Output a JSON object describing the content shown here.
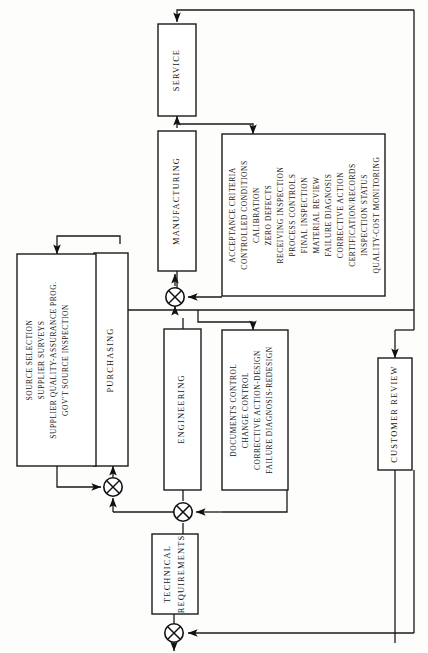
{
  "diagram": {
    "orientation": "rotated-90-ccw",
    "colors": {
      "line": "#1a1a1a",
      "box_fill": "#ffffff",
      "background": "#fdfdfc",
      "text": "#161616"
    },
    "nodes": [
      {
        "id": "service",
        "label": "SERVICE",
        "type": "process-box"
      },
      {
        "id": "manufacturing",
        "label": "MANUFACTURING",
        "type": "process-box"
      },
      {
        "id": "purchasing",
        "label": "PURCHASING",
        "type": "process-box"
      },
      {
        "id": "engineering",
        "label": "ENGINEERING",
        "type": "process-box"
      },
      {
        "id": "technical-requirements",
        "label": "TECHNICAL\nREQUIREMENTS",
        "lines": [
          "TECHNICAL",
          "REQUIREMENTS"
        ],
        "type": "process-box"
      },
      {
        "id": "customer-review",
        "label": "CUSTOMER REVIEW",
        "type": "process-box"
      }
    ],
    "detail_boxes": [
      {
        "id": "purchasing-details",
        "for": "purchasing",
        "items": [
          "SOURCE SELECTION",
          "SUPPLIER SURVEYS",
          "SUPPLIER QUALITY-ASSURANCE PROG.",
          "GOV'T SOURCE INSPECTION"
        ]
      },
      {
        "id": "manufacturing-details",
        "for": "manufacturing",
        "items": [
          "ACCEPTANCE CRITERIA",
          "CONTROLLED CONDITIONS",
          "CALIBRATION",
          "ZERO DEFECTS",
          "RECEIVING INSPECTION",
          "PROCESS CONTROLS",
          "FINAL INSPECTION",
          "MATERIAL REVIEW",
          "FAILURE  DIAGNOSIS",
          "CORRECTIVE ACTION",
          "CERTIFICATION/RECORDS",
          "INSPECTION STATUS",
          "QUALITY-COST MONITORING"
        ]
      },
      {
        "id": "engineering-details",
        "for": "engineering",
        "items": [
          "DOCUMENTS CONTROL",
          "CHANGE CONTROL",
          "CORRECTIVE ACTION-DESIGN",
          "FAILURE DIAGNOSIS-REDESIGN"
        ]
      }
    ],
    "junctions": [
      {
        "id": "junction-manufacturing",
        "x": 175,
        "y": 297
      },
      {
        "id": "junction-purchasing",
        "x": 113,
        "y": 487
      },
      {
        "id": "junction-engineering",
        "x": 183,
        "y": 512
      },
      {
        "id": "junction-output",
        "x": 174,
        "y": 633
      }
    ]
  }
}
